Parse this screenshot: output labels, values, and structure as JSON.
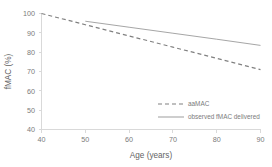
{
  "chart_data": {
    "type": "line",
    "title": "",
    "xlabel": "Age (years)",
    "ylabel": "fMAC (%)",
    "xlim": [
      40,
      90
    ],
    "ylim": [
      40,
      100
    ],
    "xticks": [
      40,
      50,
      60,
      70,
      80,
      90
    ],
    "yticks": [
      40,
      50,
      60,
      70,
      80,
      90,
      100
    ],
    "grid": false,
    "legend_position": "center-right",
    "series": [
      {
        "name": "aaMAC",
        "style": "dashed",
        "color": "#808080",
        "x": [
          40,
          50,
          60,
          70,
          80,
          90
        ],
        "values": [
          100,
          94.2,
          88.4,
          82.6,
          76.8,
          71.0
        ]
      },
      {
        "name": "observed fMAC delivered",
        "style": "solid",
        "color": "#a6a6a6",
        "x": [
          50,
          60,
          70,
          80,
          90
        ],
        "values": [
          96.0,
          92.9,
          89.8,
          86.7,
          83.5
        ]
      }
    ]
  },
  "axes": {
    "x_title": "Age (years)",
    "y_title": "fMAC (%)",
    "x_tick_labels": [
      "40",
      "50",
      "60",
      "70",
      "80",
      "90"
    ],
    "y_tick_labels": [
      "40",
      "50",
      "60",
      "70",
      "80",
      "90",
      "100"
    ]
  },
  "legend": {
    "entries": [
      {
        "label": "aaMAC",
        "style": "dashed"
      },
      {
        "label": "observed fMAC delivered",
        "style": "solid"
      }
    ]
  },
  "colors": {
    "axis": "#d9d9d9",
    "tick_text": "#7b7b7b",
    "title_text": "#636363",
    "series_dashed": "#808080",
    "series_solid": "#a6a6a6",
    "background": "#ffffff"
  }
}
